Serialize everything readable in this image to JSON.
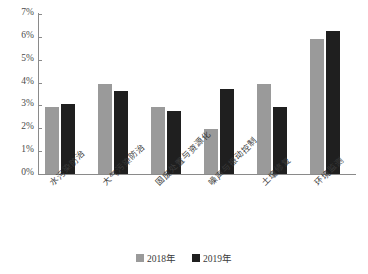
{
  "chart_data": {
    "type": "bar",
    "title": "",
    "subtitle": "",
    "xlabel": "",
    "ylabel": "",
    "ylim": [
      0,
      7
    ],
    "ytick_labels": [
      "0%",
      "1%",
      "2%",
      "3%",
      "4%",
      "5%",
      "6%",
      "7%"
    ],
    "ytick_values": [
      0,
      1,
      2,
      3,
      4,
      5,
      6,
      7
    ],
    "grid": false,
    "legend_position": "bottom-center",
    "value_unit": "%",
    "categories": [
      "水污染防治",
      "大气污染防治",
      "固废处置与资源化",
      "噪声与振动控制",
      "土壤修复",
      "环境监测"
    ],
    "series": [
      {
        "name": "2018年",
        "color": "#9a9a9a",
        "values": [
          2.95,
          3.95,
          2.95,
          1.95,
          3.95,
          5.9
        ]
      },
      {
        "name": "2019年",
        "color": "#1f1f1f",
        "values": [
          3.05,
          3.65,
          2.75,
          3.7,
          2.95,
          6.25
        ]
      }
    ]
  },
  "legend": {
    "items": [
      {
        "label": "2018年",
        "swatch": "legend-swatch-2018"
      },
      {
        "label": "2019年",
        "swatch": "legend-swatch-2019"
      }
    ]
  }
}
